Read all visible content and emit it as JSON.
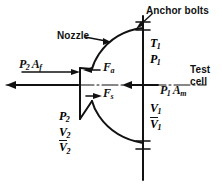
{
  "figure": {
    "ink_color": "#111111",
    "background": "#ffffff"
  },
  "callouts": {
    "anchor_bolts": "Anchor bolts",
    "nozzle": "Nozzle",
    "test_cell_line1": "Test",
    "test_cell_line2": "cell"
  },
  "forces": {
    "exit_pressure_force": {
      "base": "P",
      "sub": "2",
      "base2": "A",
      "sub2": "f"
    },
    "axial_force": {
      "base": "F",
      "sub": "a"
    },
    "shear_force": {
      "base": "F",
      "sub": "s"
    },
    "inlet_pressure_force": {
      "base": "P",
      "sub": "1",
      "base2": "A",
      "sub2": "m"
    }
  },
  "states": {
    "upstream": [
      {
        "base": "T",
        "sub": "1",
        "overbar": false
      },
      {
        "base": "P",
        "sub": "1",
        "overbar": false
      }
    ],
    "upstream_velocity": [
      {
        "base": "V",
        "sub": "1",
        "overbar": false
      },
      {
        "base": "V",
        "sub": "1",
        "overbar": true
      }
    ],
    "downstream": [
      {
        "base": "P",
        "sub": "2",
        "overbar": false
      },
      {
        "base": "V",
        "sub": "2",
        "overbar": false
      },
      {
        "base": "V",
        "sub": "2",
        "overbar": true
      }
    ]
  }
}
